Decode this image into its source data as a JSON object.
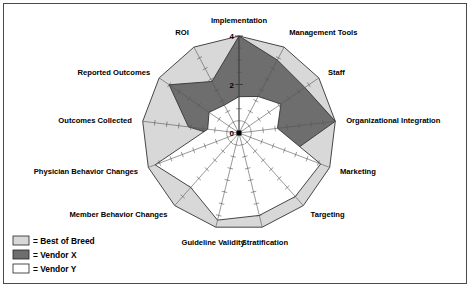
{
  "chart_data": {
    "type": "radar",
    "title": "",
    "categories": [
      "Implementation",
      "Management Tools",
      "Staff",
      "Organizational Integration",
      "Marketing",
      "Targeting",
      "Stratification",
      "Guideline Validity",
      "Member Behavior Changes",
      "Physician Behavior Changes",
      "Outcomes Collected",
      "Reported Outcomes",
      "ROI"
    ],
    "series": [
      {
        "name": "Best of Breed",
        "color": "#d8d8d8",
        "values": [
          4,
          4,
          4,
          4,
          4,
          4,
          4,
          4,
          4,
          4,
          4,
          4,
          4
        ]
      },
      {
        "name": "Vendor X",
        "color": "#6e6e6e",
        "values": [
          4,
          3.4,
          3.3,
          4,
          2.3,
          0.5,
          0.5,
          0.4,
          2.1,
          0.6,
          2.1,
          3.5,
          2.4
        ]
      },
      {
        "name": "Vendor Y",
        "color": "#ffffff",
        "values": [
          1.5,
          1.7,
          2.1,
          1.6,
          3.6,
          3.5,
          3.5,
          3.7,
          3.0,
          3.7,
          1.3,
          1.5,
          1.3
        ]
      }
    ],
    "radial_ticks": [
      0,
      2,
      4
    ],
    "radial_tick_labels": [
      "0",
      "2",
      "4"
    ],
    "rlim": [
      0,
      4
    ],
    "minor_tick_step": 0.5,
    "grid": "spokes-with-ticks",
    "legend_position": "bottom-left"
  },
  "legend": {
    "items": [
      {
        "swatch": "best-of-breed",
        "text": "= Best of Breed",
        "color": "#d8d8d8"
      },
      {
        "swatch": "vendor-x",
        "text": "= Vendor X",
        "color": "#6e6e6e"
      },
      {
        "swatch": "vendor-y",
        "text": "= Vendor Y",
        "color": "#ffffff"
      }
    ]
  }
}
